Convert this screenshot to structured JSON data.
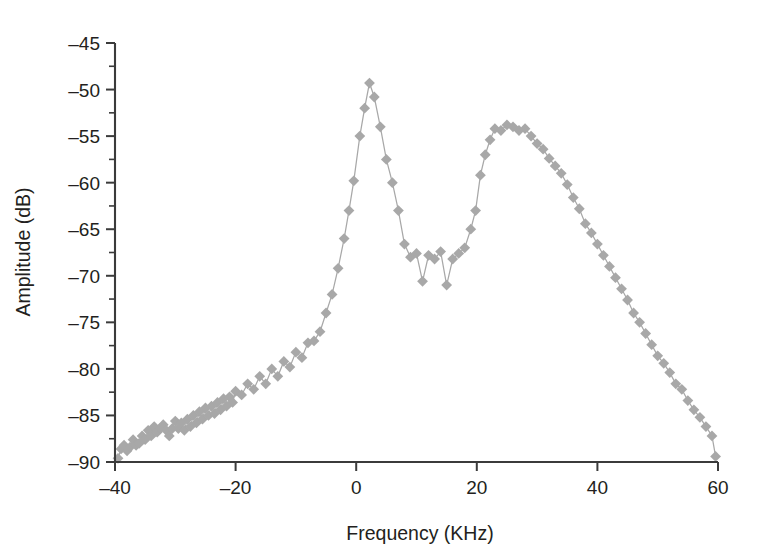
{
  "chart_data": {
    "type": "scatter",
    "title": "",
    "subtitle": "",
    "xlabel": "Frequency (KHz)",
    "ylabel": "Amplitude (dB)",
    "xlim": [
      -40,
      60
    ],
    "ylim": [
      -90,
      -45
    ],
    "xticks": [
      -40,
      -20,
      0,
      20,
      40,
      60
    ],
    "xtick_labels": [
      "-40",
      "-20",
      "0",
      "20",
      "40",
      "60"
    ],
    "yticks": [
      -90,
      -85,
      -80,
      -75,
      -70,
      -65,
      -60,
      -55,
      -50,
      -45
    ],
    "ytick_labels": [
      "-90",
      "-85",
      "-80",
      "-75",
      "-70",
      "-65",
      "-60",
      "-55",
      "-50",
      "-45"
    ],
    "y_minor_tick_step": 2.5,
    "grid": false,
    "legend": null,
    "marker": "diamond",
    "marker_color": "#a8a8a8",
    "line_color": "#a8a8a8",
    "axis_color": "#3b3b3b",
    "series": [
      {
        "name": "spectrum",
        "x": [
          -39.5,
          -39.0,
          -38.5,
          -38.0,
          -37.5,
          -37.0,
          -36.5,
          -36.0,
          -35.5,
          -35.0,
          -34.5,
          -34.0,
          -33.5,
          -33.0,
          -32.5,
          -32.0,
          -31.5,
          -31.0,
          -30.5,
          -30.0,
          -29.5,
          -29.0,
          -28.5,
          -28.0,
          -27.5,
          -27.0,
          -26.5,
          -26.0,
          -25.5,
          -25.0,
          -24.5,
          -24.0,
          -23.5,
          -23.0,
          -22.5,
          -22.0,
          -21.5,
          -21.0,
          -20.5,
          -20.0,
          -19.0,
          -18.0,
          -17.0,
          -16.0,
          -15.0,
          -14.0,
          -13.0,
          -12.0,
          -11.0,
          -10.0,
          -9.0,
          -8.0,
          -7.0,
          -6.0,
          -5.0,
          -4.0,
          -3.0,
          -2.0,
          -1.2,
          -0.4,
          0.6,
          1.4,
          2.2,
          3.0,
          4.0,
          5.0,
          6.0,
          7.0,
          8.0,
          9.0,
          10.0,
          11.0,
          12.0,
          13.0,
          14.0,
          15.0,
          16.0,
          17.0,
          18.0,
          19.0,
          19.8,
          20.6,
          21.4,
          22.2,
          23.0,
          24.0,
          25.0,
          26.0,
          27.0,
          28.0,
          29.0,
          30.0,
          31.0,
          32.0,
          33.0,
          34.0,
          35.0,
          36.0,
          37.0,
          38.0,
          39.0,
          40.0,
          41.0,
          42.0,
          43.0,
          44.0,
          45.0,
          46.0,
          47.0,
          48.0,
          49.0,
          50.0,
          51.0,
          52.0,
          53.0,
          54.0,
          55.0,
          56.0,
          57.0,
          58.0,
          59.0,
          59.6
        ],
        "y": [
          -89.6,
          -88.6,
          -88.2,
          -88.8,
          -88.4,
          -87.6,
          -88.2,
          -88.0,
          -87.2,
          -87.6,
          -86.6,
          -87.2,
          -86.2,
          -86.8,
          -86.4,
          -86.0,
          -86.6,
          -87.2,
          -86.4,
          -85.6,
          -86.4,
          -85.8,
          -86.6,
          -85.4,
          -86.2,
          -85.0,
          -85.8,
          -84.6,
          -85.4,
          -84.2,
          -85.0,
          -84.0,
          -84.8,
          -83.6,
          -84.4,
          -83.2,
          -84.0,
          -83.0,
          -83.6,
          -82.4,
          -82.8,
          -81.6,
          -82.2,
          -80.8,
          -81.6,
          -80.0,
          -80.8,
          -79.2,
          -79.8,
          -78.2,
          -78.8,
          -77.2,
          -77.0,
          -76.0,
          -74.0,
          -72.0,
          -69.2,
          -66.0,
          -63.0,
          -59.8,
          -55.0,
          -52.0,
          -49.3,
          -50.8,
          -54.0,
          -57.5,
          -60.0,
          -63.0,
          -66.6,
          -68.0,
          -67.6,
          -70.6,
          -67.8,
          -68.2,
          -67.4,
          -71.0,
          -68.2,
          -67.6,
          -67.0,
          -65.0,
          -63.0,
          -59.2,
          -57.0,
          -55.4,
          -54.2,
          -54.4,
          -53.8,
          -54.0,
          -54.4,
          -54.2,
          -55.0,
          -55.8,
          -56.4,
          -57.4,
          -58.2,
          -59.0,
          -60.2,
          -61.6,
          -62.8,
          -64.4,
          -65.4,
          -66.6,
          -67.8,
          -69.0,
          -70.2,
          -71.4,
          -72.6,
          -74.0,
          -75.0,
          -76.2,
          -77.4,
          -78.6,
          -79.4,
          -80.4,
          -81.6,
          -82.2,
          -83.4,
          -84.4,
          -85.2,
          -86.2,
          -87.2,
          -89.4
        ]
      }
    ]
  },
  "axis": {
    "x_title": "Frequency (KHz)",
    "y_title": "Amplitude (dB)"
  }
}
